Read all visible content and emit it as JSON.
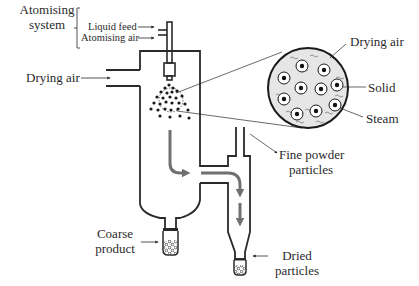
{
  "diagram": {
    "type": "spray dryer schematic",
    "labels": {
      "atomising_system_line1": "Atomising",
      "atomising_system_line2": "system",
      "liquid_feed": "Liquid feed",
      "atomising_air": "Atomising air",
      "drying_air_inlet": "Drying air",
      "drying_air_detail": "Drying air",
      "solid": "Solid",
      "steam": "Steam",
      "fine_powder_line1": "Fine powder",
      "fine_powder_line2": "particles",
      "coarse_product_line1": "Coarse",
      "coarse_product_line2": "product",
      "dried_particles_line1": "Dried",
      "dried_particles_line2": "particles"
    },
    "colors": {
      "outline": "#2a2a2a",
      "flow_arrow": "#707070",
      "detail_fill": "#e6e6e6",
      "background": "#ffffff"
    }
  }
}
